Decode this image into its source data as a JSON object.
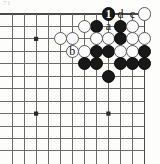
{
  "figure": {
    "kind": "go-board-corner-diagram",
    "corner_tag": "71",
    "width": 160,
    "height": 164,
    "grid": {
      "cols": 12,
      "rows": 12,
      "x0": 12,
      "y0": 14,
      "step_x": 12.05,
      "step_y": 12.45,
      "line_color": "#6b6b6b",
      "edge_color": "#4a4a4a",
      "line_width": 1,
      "edge_width": 1.6,
      "show_top_edge": true,
      "show_right_edge": true
    },
    "star_points": [
      {
        "col": 2,
        "row": 2
      },
      {
        "col": 2,
        "row": 8
      },
      {
        "col": 8,
        "row": 8
      }
    ],
    "stone_radius": 6.6,
    "colors": {
      "black": "#181818",
      "white": "#fcfcfc",
      "white_border": "#5a5a5a",
      "board": "#fdfdfc"
    },
    "stones": [
      {
        "id": "w-k1",
        "color": "white",
        "col": 11,
        "row": 0
      },
      {
        "id": "b-move1",
        "color": "black",
        "col": 8,
        "row": 0
      },
      {
        "id": "b-h2",
        "color": "black",
        "col": 9,
        "row": 1
      },
      {
        "id": "w-j2",
        "color": "white",
        "col": 10,
        "row": 1
      },
      {
        "id": "b-g2",
        "color": "black",
        "col": 7,
        "row": 1
      },
      {
        "id": "w-f2",
        "color": "white",
        "col": 6,
        "row": 1
      },
      {
        "id": "w-d3",
        "color": "white",
        "col": 4,
        "row": 2
      },
      {
        "id": "w-e3",
        "color": "white",
        "col": 5,
        "row": 2
      },
      {
        "id": "w-g3",
        "color": "white",
        "col": 7,
        "row": 2
      },
      {
        "id": "w-h3",
        "color": "white",
        "col": 8,
        "row": 2
      },
      {
        "id": "b-j3",
        "color": "black",
        "col": 9,
        "row": 2
      },
      {
        "id": "w-k3",
        "color": "white",
        "col": 10,
        "row": 2
      },
      {
        "id": "w-l3",
        "color": "white",
        "col": 11,
        "row": 2
      },
      {
        "id": "w-e4",
        "color": "white",
        "col": 5,
        "row": 3
      },
      {
        "id": "w-f4",
        "color": "white",
        "col": 6,
        "row": 3
      },
      {
        "id": "b-g4",
        "color": "black",
        "col": 7,
        "row": 3
      },
      {
        "id": "b-h4",
        "color": "black",
        "col": 8,
        "row": 3
      },
      {
        "id": "w-j4",
        "color": "white",
        "col": 9,
        "row": 3
      },
      {
        "id": "w-k4",
        "color": "white",
        "col": 10,
        "row": 3
      },
      {
        "id": "b-l4",
        "color": "black",
        "col": 11,
        "row": 3
      },
      {
        "id": "b-f5",
        "color": "black",
        "col": 6,
        "row": 4
      },
      {
        "id": "b-g5",
        "color": "black",
        "col": 7,
        "row": 4
      },
      {
        "id": "b-j5",
        "color": "black",
        "col": 9,
        "row": 4
      },
      {
        "id": "b-k5",
        "color": "black",
        "col": 10,
        "row": 4
      },
      {
        "id": "b-l5",
        "color": "black",
        "col": 11,
        "row": 4
      },
      {
        "id": "b-h6",
        "color": "black",
        "col": 8,
        "row": 5
      }
    ],
    "markers": [
      {
        "id": "marker-1",
        "label": "1",
        "col": 8,
        "row": 0,
        "placement": "on-stone",
        "font_size": 12
      },
      {
        "id": "marker-d",
        "label": "d",
        "col": 9,
        "row": 0,
        "placement": "on-board",
        "font_size": 12
      },
      {
        "id": "marker-c",
        "label": "c",
        "col": 10,
        "row": 0,
        "placement": "on-board",
        "font_size": 12
      },
      {
        "id": "marker-a",
        "label": "a",
        "col": 8,
        "row": 1,
        "placement": "on-board",
        "font_size": 12
      },
      {
        "id": "marker-b",
        "label": "b",
        "col": 5,
        "row": 3,
        "placement": "on-board",
        "font_size": 12
      }
    ]
  }
}
